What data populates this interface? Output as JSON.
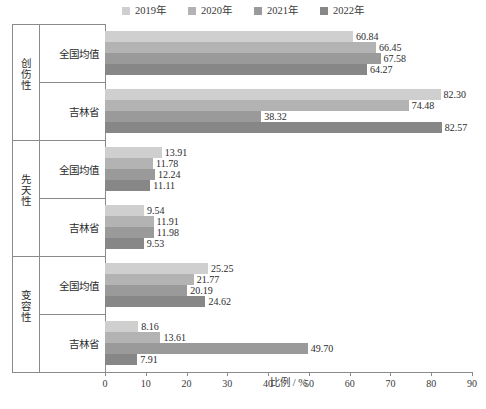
{
  "chart_data": {
    "type": "bar",
    "orientation": "horizontal",
    "title": "",
    "xlabel": "比例 / %",
    "ylabel": "",
    "xlim": [
      0,
      90
    ],
    "xticks": [
      0,
      10,
      20,
      30,
      40,
      50,
      60,
      70,
      80,
      90
    ],
    "grid": false,
    "legend_position": "top-center",
    "legend": [
      "2019年",
      "2020年",
      "2021年",
      "2022年"
    ],
    "series_colors": [
      "#cfcfcf",
      "#b3b3b3",
      "#9a9a9a",
      "#878787"
    ],
    "group_labels": [
      "创伤性",
      "先天性",
      "变容性"
    ],
    "subcategories": [
      "全国均值",
      "吉林省"
    ],
    "categories": [
      "创伤性 · 全国均值",
      "创伤性 · 吉林省",
      "先天性 · 全国均值",
      "先天性 · 吉林省",
      "变容性 · 全国均值",
      "变容性 · 吉林省"
    ],
    "series": [
      {
        "name": "2019年",
        "values": [
          60.84,
          82.3,
          13.91,
          9.54,
          25.25,
          8.16
        ]
      },
      {
        "name": "2020年",
        "values": [
          66.45,
          74.48,
          11.78,
          11.91,
          21.77,
          13.61
        ]
      },
      {
        "name": "2021年",
        "values": [
          67.58,
          38.32,
          12.24,
          11.98,
          20.19,
          49.7
        ]
      },
      {
        "name": "2022年",
        "values": [
          64.27,
          82.57,
          11.11,
          9.53,
          24.62,
          7.91
        ]
      }
    ],
    "groups": [
      {
        "group": "创伤性",
        "rows": [
          {
            "label": "全国均值",
            "values": [
              60.84,
              66.45,
              67.58,
              64.27
            ]
          },
          {
            "label": "吉林省",
            "values": [
              82.3,
              74.48,
              38.32,
              82.57
            ]
          }
        ]
      },
      {
        "group": "先天性",
        "rows": [
          {
            "label": "全国均值",
            "values": [
              13.91,
              11.78,
              12.24,
              11.11
            ]
          },
          {
            "label": "吉林省",
            "values": [
              9.54,
              11.91,
              11.98,
              9.53
            ]
          }
        ]
      },
      {
        "group": "变容性",
        "rows": [
          {
            "label": "全国均值",
            "values": [
              25.25,
              21.77,
              20.19,
              24.62
            ]
          },
          {
            "label": "吉林省",
            "values": [
              8.16,
              13.61,
              49.7,
              7.91
            ]
          }
        ]
      }
    ]
  },
  "caption": ""
}
